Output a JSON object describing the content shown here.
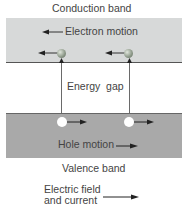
{
  "diagram": {
    "conduction_band": {
      "label": "Conduction band",
      "color": "#d7d9d9"
    },
    "valence_band": {
      "label": "Valence band",
      "color": "#a9a9a9"
    },
    "electron_motion": {
      "label": "Electron motion",
      "direction": "left"
    },
    "hole_motion": {
      "label": "Hole motion",
      "direction": "right"
    },
    "energy_gap": {
      "label": "Energy  gap"
    },
    "legend": {
      "line1": "Electric field",
      "line2": "and current",
      "direction": "right"
    }
  }
}
